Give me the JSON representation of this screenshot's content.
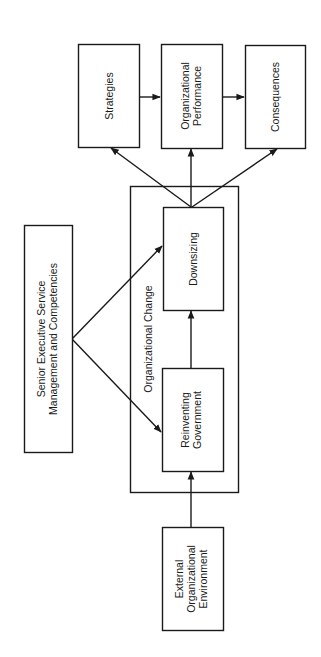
{
  "diagram": {
    "orientation": "rotated-90-ccw",
    "nodes": {
      "strategies": {
        "lines": [
          "Strategies"
        ]
      },
      "performance": {
        "lines": [
          "Organizational",
          "Performance"
        ]
      },
      "consequences": {
        "lines": [
          "Consequences"
        ]
      },
      "org_change": {
        "label": "Organizational Change"
      },
      "downsizing": {
        "lines": [
          "Downsizing"
        ]
      },
      "reinventing": {
        "lines": [
          "Reinventing",
          "Government"
        ]
      },
      "senior": {
        "lines": [
          "Senior Executive Service",
          "Management and Competencies"
        ]
      },
      "external": {
        "lines": [
          "External",
          "Organizational",
          "Environment"
        ]
      }
    },
    "edges": [
      {
        "from": "External Organizational Environment",
        "to": "Reinventing Government"
      },
      {
        "from": "Reinventing Government",
        "to": "Downsizing"
      },
      {
        "from": "Senior Executive Service Management and Competencies",
        "to": "Reinventing Government"
      },
      {
        "from": "Senior Executive Service Management and Competencies",
        "to": "Downsizing"
      },
      {
        "from": "Downsizing",
        "to": "Strategies"
      },
      {
        "from": "Downsizing",
        "to": "Organizational Performance"
      },
      {
        "from": "Downsizing",
        "to": "Consequences"
      },
      {
        "from": "Strategies",
        "to": "Organizational Performance"
      },
      {
        "from": "Organizational Performance",
        "to": "Consequences"
      }
    ],
    "colors": {
      "stroke": "#1a1a1a",
      "background": "#ffffff"
    }
  }
}
